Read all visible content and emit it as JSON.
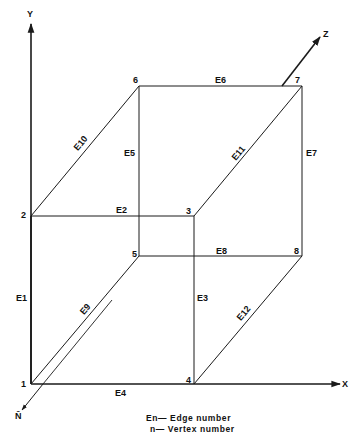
{
  "diagram": {
    "axes": {
      "x": {
        "label": "X"
      },
      "y": {
        "label": "Y"
      },
      "z": {
        "label": "Z"
      },
      "n": {
        "label": "N̄"
      }
    },
    "vertices": [
      {
        "id": "1",
        "x": 31,
        "y": 384
      },
      {
        "id": "2",
        "x": 31,
        "y": 216
      },
      {
        "id": "3",
        "x": 194,
        "y": 216
      },
      {
        "id": "4",
        "x": 194,
        "y": 384
      },
      {
        "id": "5",
        "x": 139,
        "y": 256
      },
      {
        "id": "6",
        "x": 139,
        "y": 86
      },
      {
        "id": "7",
        "x": 302,
        "y": 86
      },
      {
        "id": "8",
        "x": 302,
        "y": 256
      }
    ],
    "edges": [
      {
        "id": "E1",
        "from": "1",
        "to": "2"
      },
      {
        "id": "E2",
        "from": "2",
        "to": "3"
      },
      {
        "id": "E3",
        "from": "3",
        "to": "4"
      },
      {
        "id": "E4",
        "from": "1",
        "to": "4"
      },
      {
        "id": "E5",
        "from": "5",
        "to": "6"
      },
      {
        "id": "E6",
        "from": "6",
        "to": "7"
      },
      {
        "id": "E7",
        "from": "7",
        "to": "8"
      },
      {
        "id": "E8",
        "from": "5",
        "to": "8"
      },
      {
        "id": "E9",
        "from": "1",
        "to": "5"
      },
      {
        "id": "E10",
        "from": "2",
        "to": "6"
      },
      {
        "id": "E11",
        "from": "3",
        "to": "7"
      },
      {
        "id": "E12",
        "from": "4",
        "to": "8"
      }
    ],
    "legend": {
      "line1": "En— Edge number",
      "line2": "n— Vertex number"
    },
    "colors": {
      "stroke": "#1a1a1a",
      "background": "#ffffff"
    }
  }
}
